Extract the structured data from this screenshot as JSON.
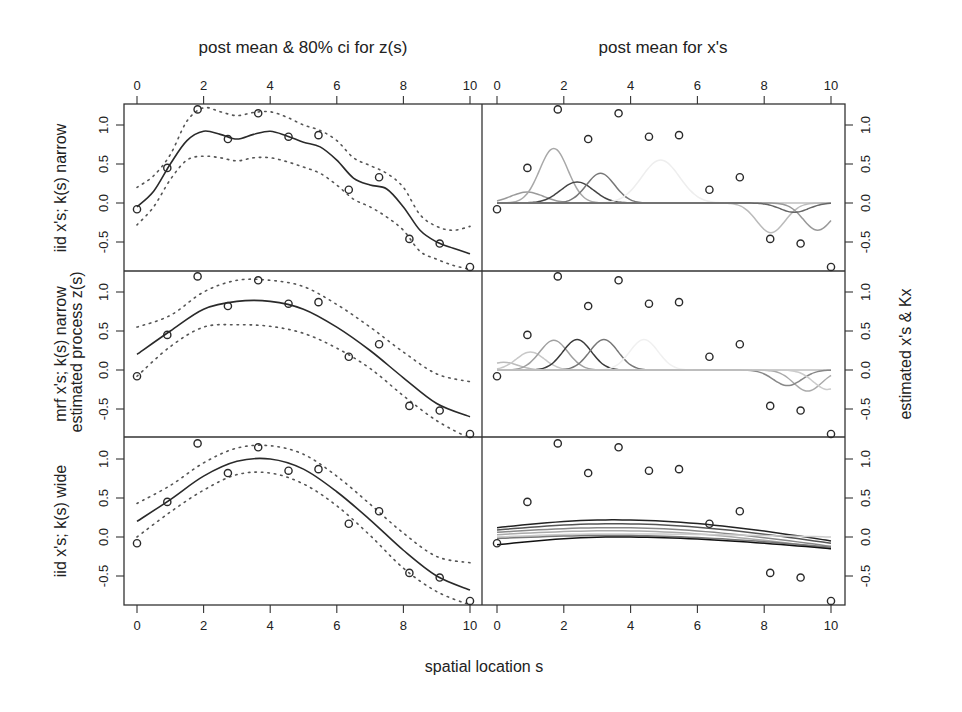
{
  "chart_data": {
    "type": "line",
    "layout": "3x2 panel grid",
    "titles": {
      "left_column": "post mean & 80% ci for z(s)",
      "right_column": "post mean for x's"
    },
    "xlabel": "spatial location s",
    "ylabel_left": "estimated process z(s)",
    "ylabel_right": "estimated x's & Kx",
    "row_labels": [
      "iid x's; k(s) narrow",
      "mrf x's; k(s) narrow",
      "iid x's; k(s) wide"
    ],
    "xlim": [
      0,
      10
    ],
    "ylim": [
      -0.85,
      1.28
    ],
    "x_ticks": [
      "0",
      "2",
      "4",
      "6",
      "8",
      "10"
    ],
    "y_ticks": [
      "-0.5",
      "0.0",
      "0.5",
      "1.0"
    ],
    "observations": {
      "x": [
        0,
        0.91,
        1.82,
        2.73,
        3.64,
        4.55,
        5.45,
        6.36,
        7.27,
        8.18,
        9.09,
        10
      ],
      "y": [
        -0.08,
        0.45,
        1.2,
        0.82,
        1.15,
        0.85,
        0.87,
        0.17,
        0.33,
        -0.46,
        -0.52,
        -0.82
      ]
    },
    "panels": [
      {
        "row": 0,
        "column": "left",
        "series": [
          {
            "name": "posterior mean",
            "style": "solid",
            "x": [
              0,
              0.5,
              1,
              1.5,
              2,
              2.5,
              3,
              3.5,
              4,
              4.5,
              5,
              5.5,
              6,
              6.5,
              7,
              7.5,
              8,
              8.5,
              9,
              9.5,
              10
            ],
            "y": [
              -0.05,
              0.15,
              0.5,
              0.8,
              0.92,
              0.88,
              0.82,
              0.88,
              0.92,
              0.86,
              0.78,
              0.72,
              0.55,
              0.32,
              0.23,
              0.18,
              -0.05,
              -0.35,
              -0.5,
              -0.58,
              -0.65
            ]
          },
          {
            "name": "upper 80% ci",
            "style": "dotted",
            "x": [
              0,
              0.5,
              1,
              1.5,
              2,
              2.5,
              3,
              3.5,
              4,
              4.5,
              5,
              5.5,
              6,
              6.5,
              7,
              7.5,
              8,
              8.5,
              9,
              9.5,
              10
            ],
            "y": [
              0.2,
              0.35,
              0.62,
              1.05,
              1.22,
              1.17,
              1.12,
              1.16,
              1.17,
              1.1,
              1.0,
              0.93,
              0.8,
              0.58,
              0.48,
              0.38,
              0.2,
              -0.15,
              -0.3,
              -0.35,
              -0.3
            ]
          },
          {
            "name": "lower 80% ci",
            "style": "dotted",
            "x": [
              0,
              0.5,
              1,
              1.5,
              2,
              2.5,
              3,
              3.5,
              4,
              4.5,
              5,
              5.5,
              6,
              6.5,
              7,
              7.5,
              8,
              8.5,
              9,
              9.5,
              10
            ],
            "y": [
              -0.28,
              -0.05,
              0.3,
              0.55,
              0.6,
              0.58,
              0.54,
              0.58,
              0.58,
              0.53,
              0.46,
              0.38,
              0.23,
              0.05,
              -0.05,
              -0.18,
              -0.35,
              -0.62,
              -0.72,
              -0.8,
              -0.85
            ]
          }
        ]
      },
      {
        "row": 1,
        "column": "left",
        "series": [
          {
            "name": "posterior mean",
            "style": "solid",
            "x": [
              0,
              1,
              2,
              3,
              4,
              5,
              6,
              7,
              8,
              9,
              10
            ],
            "y": [
              0.2,
              0.5,
              0.78,
              0.88,
              0.88,
              0.78,
              0.55,
              0.25,
              -0.1,
              -0.43,
              -0.6
            ]
          },
          {
            "name": "upper 80% ci",
            "style": "dotted",
            "x": [
              0,
              1,
              2,
              3,
              4,
              5,
              6,
              7,
              8,
              9,
              10
            ],
            "y": [
              0.55,
              0.7,
              1.0,
              1.15,
              1.15,
              1.07,
              0.84,
              0.55,
              0.23,
              -0.05,
              -0.15
            ]
          },
          {
            "name": "lower 80% ci",
            "style": "dotted",
            "x": [
              0,
              1,
              2,
              3,
              4,
              5,
              6,
              7,
              8,
              9,
              10
            ],
            "y": [
              -0.08,
              0.3,
              0.55,
              0.58,
              0.56,
              0.47,
              0.28,
              0.02,
              -0.33,
              -0.65,
              -0.88
            ]
          }
        ]
      },
      {
        "row": 2,
        "column": "left",
        "series": [
          {
            "name": "posterior mean",
            "style": "solid",
            "x": [
              0,
              1,
              2,
              3,
              4,
              5,
              6,
              7,
              8,
              9,
              10
            ],
            "y": [
              0.2,
              0.48,
              0.78,
              0.97,
              1.0,
              0.87,
              0.58,
              0.22,
              -0.17,
              -0.5,
              -0.68
            ]
          },
          {
            "name": "upper 80% ci",
            "style": "dotted",
            "x": [
              0,
              1,
              2,
              3,
              4,
              5,
              6,
              7,
              8,
              9,
              10
            ],
            "y": [
              0.43,
              0.66,
              0.95,
              1.14,
              1.17,
              1.06,
              0.78,
              0.42,
              0.05,
              -0.25,
              -0.33
            ]
          },
          {
            "name": "lower 80% ci",
            "style": "dotted",
            "x": [
              0,
              1,
              2,
              3,
              4,
              5,
              6,
              7,
              8,
              9,
              10
            ],
            "y": [
              0.0,
              0.32,
              0.6,
              0.8,
              0.82,
              0.68,
              0.4,
              0.02,
              -0.4,
              -0.7,
              -0.87
            ]
          }
        ]
      },
      {
        "row": 0,
        "column": "right",
        "description": "narrow kernel basis components Kx (multiple gray bumps)",
        "series": [
          {
            "name": "Kx 1",
            "color": "#9a9a9a",
            "center": 0.9,
            "amp": 0.14,
            "width": 0.7
          },
          {
            "name": "Kx 2",
            "color": "#a8a8a8",
            "center": 1.7,
            "amp": 0.7,
            "width": 0.6
          },
          {
            "name": "Kx 3",
            "color": "#444444",
            "center": 2.4,
            "amp": 0.27,
            "width": 0.7
          },
          {
            "name": "Kx 4",
            "color": "#777777",
            "center": 3.1,
            "amp": 0.38,
            "width": 0.6
          },
          {
            "name": "Kx 5",
            "color": "#eeeeee",
            "center": 4.9,
            "amp": 0.55,
            "width": 0.8
          },
          {
            "name": "Kx 6",
            "color": "#bbbbbb",
            "center": 8.2,
            "amp": -0.38,
            "width": 0.6
          },
          {
            "name": "Kx 7",
            "color": "#999999",
            "center": 9.6,
            "amp": -0.35,
            "width": 0.6
          },
          {
            "name": "Kx 8",
            "color": "#666666",
            "center": 8.9,
            "amp": -0.12,
            "width": 0.6
          }
        ]
      },
      {
        "row": 1,
        "column": "right",
        "description": "mrf narrow kernel components",
        "series": [
          {
            "name": "Kx 1",
            "color": "#bbbbbb",
            "center": 0.2,
            "amp": 0.1,
            "width": 0.6
          },
          {
            "name": "Kx 2",
            "color": "#c8c8c8",
            "center": 1.0,
            "amp": 0.23,
            "width": 0.6
          },
          {
            "name": "Kx 3",
            "color": "#a0a0a0",
            "center": 1.7,
            "amp": 0.38,
            "width": 0.6
          },
          {
            "name": "Kx 4",
            "color": "#3a3a3a",
            "center": 2.4,
            "amp": 0.39,
            "width": 0.6
          },
          {
            "name": "Kx 5",
            "color": "#777777",
            "center": 3.2,
            "amp": 0.39,
            "width": 0.6
          },
          {
            "name": "Kx 6",
            "color": "#f0f0f0",
            "center": 4.4,
            "amp": 0.39,
            "width": 0.6
          },
          {
            "name": "Kx 7",
            "color": "#aaaaaa",
            "center": 9.3,
            "amp": -0.27,
            "width": 0.6
          },
          {
            "name": "Kx 8",
            "color": "#888888",
            "center": 8.7,
            "amp": -0.2,
            "width": 0.6
          },
          {
            "name": "Kx 9",
            "color": "#cccccc",
            "center": 9.9,
            "amp": -0.25,
            "width": 0.6
          }
        ]
      },
      {
        "row": 2,
        "column": "right",
        "description": "wide kernel components (broad, flat curves)",
        "series": [
          {
            "name": "Kx 1",
            "color": "#222222",
            "y0": 0.12,
            "ymid": 0.22,
            "y10": -0.05
          },
          {
            "name": "Kx 2",
            "color": "#555555",
            "y0": 0.09,
            "ymid": 0.17,
            "y10": -0.08
          },
          {
            "name": "Kx 3",
            "color": "#888888",
            "y0": 0.06,
            "ymid": 0.12,
            "y10": -0.12
          },
          {
            "name": "Kx 4",
            "color": "#aaaaaa",
            "y0": 0.03,
            "ymid": 0.08,
            "y10": -0.15
          },
          {
            "name": "Kx 5",
            "color": "#cccccc",
            "y0": 0.0,
            "ymid": 0.04,
            "y10": 0.0
          },
          {
            "name": "Kx 6",
            "color": "#777777",
            "y0": -0.02,
            "ymid": 0.02,
            "y10": -0.13
          },
          {
            "name": "Kx 7",
            "color": "#111111",
            "y0": -0.1,
            "ymid": 0.0,
            "y10": -0.15
          }
        ]
      }
    ]
  }
}
